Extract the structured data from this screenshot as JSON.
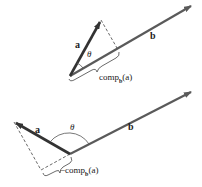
{
  "colors": {
    "vector_a": "#3a3a3a",
    "vector_b": "#5a5a5a",
    "dashed": "#444444",
    "text": "#222222"
  },
  "top_diagram": {
    "vector_a_label": "a",
    "vector_b_label": "b",
    "angle_label": "θ",
    "component_label_prefix": "comp",
    "component_label_sub": "b",
    "component_label_arg": "(a)"
  },
  "bottom_diagram": {
    "vector_a_label": "a",
    "vector_b_label": "b",
    "angle_label": "θ",
    "component_label_prefix": "−comp",
    "component_label_sub": "b",
    "component_label_arg": "(a)"
  }
}
